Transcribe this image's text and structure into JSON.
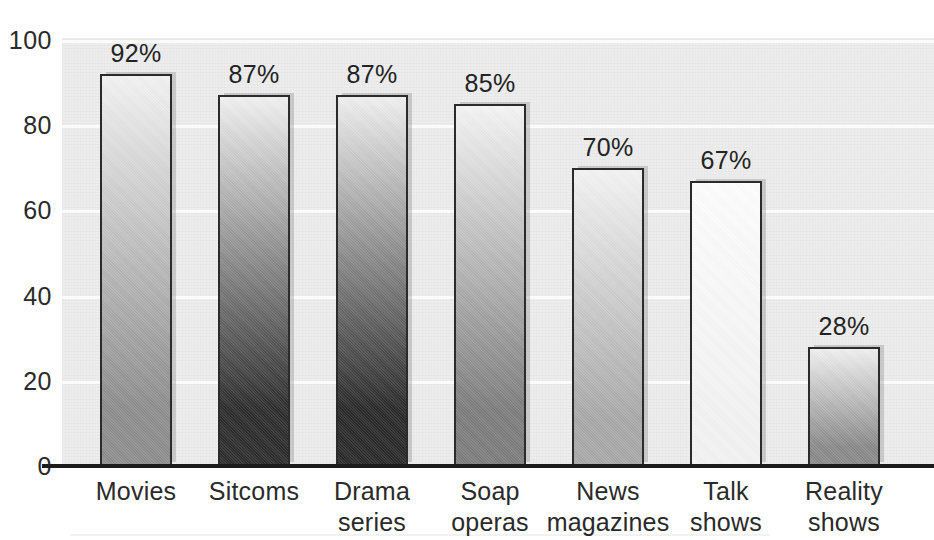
{
  "chart_data": {
    "type": "bar",
    "title": "",
    "subtitle": "",
    "xlabel": "",
    "ylabel": "",
    "categories": [
      "Movies",
      "Sitcoms",
      "Drama series",
      "Soap operas",
      "News magazines",
      "Talk shows",
      "Reality shows"
    ],
    "category_lines": [
      [
        "Movies"
      ],
      [
        "Sitcoms"
      ],
      [
        "Drama",
        "series"
      ],
      [
        "Soap",
        "operas"
      ],
      [
        "News",
        "magazines"
      ],
      [
        "Talk",
        "shows"
      ],
      [
        "Reality",
        "shows"
      ]
    ],
    "values": [
      92,
      87,
      87,
      85,
      70,
      67,
      28
    ],
    "data_labels": [
      "92%",
      "87%",
      "87%",
      "85%",
      "70%",
      "67%",
      "28%"
    ],
    "ylim": [
      0,
      100
    ],
    "ytick_labels": [
      "100",
      "80",
      "60",
      "40",
      "20",
      "0"
    ],
    "ytick_values": [
      100,
      80,
      60,
      40,
      20,
      0
    ],
    "grid": true,
    "grid_orientation": "horizontal",
    "legend": "none",
    "bar_colors_top": [
      "#f2f2f2",
      "#f0f0f0",
      "#efefef",
      "#f4f4f4",
      "#f3f3f3",
      "#fdfdfd",
      "#efefef"
    ],
    "bar_colors_bottom": [
      "#8e8e8e",
      "#2e2e2e",
      "#2b2b2b",
      "#7d7d7d",
      "#a8a8a8",
      "#f2f2f2",
      "#8a8a8a"
    ],
    "plot_background": "#ededed",
    "gridline_color": "#fbfbfb",
    "axis_color": "#1c1c1c",
    "bar_border_color": "#2b2b2b",
    "text_color": "#2a2a2a"
  },
  "layout": {
    "bar_left_px": [
      100,
      218,
      336,
      454,
      572,
      690,
      808
    ],
    "bar_width_px": 72,
    "label_center_px": [
      136,
      254,
      372,
      490,
      608,
      726,
      844
    ]
  }
}
